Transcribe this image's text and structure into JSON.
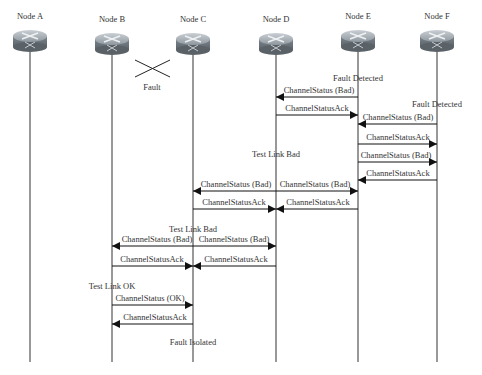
{
  "nodes": [
    {
      "label": "Node A",
      "x": 30
    },
    {
      "label": "Node B",
      "x": 112
    },
    {
      "label": "Node C",
      "x": 193
    },
    {
      "label": "Node D",
      "x": 276
    },
    {
      "label": "Node E",
      "x": 358
    },
    {
      "label": "Node F",
      "x": 437
    }
  ],
  "fault": {
    "label": "Fault"
  },
  "notes": {
    "fault_detected_e": "Fault Detected",
    "fault_detected_f": "Fault Detected",
    "test_link_bad_d": "Test Link Bad",
    "test_link_bad_c": "Test Link Bad",
    "test_link_ok_b": "Test Link OK",
    "fault_isolated": "Fault Isolated"
  },
  "messages": [
    {
      "label": "ChannelStatus (Bad)",
      "from": "E",
      "to": "D"
    },
    {
      "label": "ChannelStatusAck",
      "from": "D",
      "to": "E"
    },
    {
      "label": "ChannelStatus (Bad)",
      "from": "F",
      "to": "E"
    },
    {
      "label": "ChannelStatusAck",
      "from": "E",
      "to": "F"
    },
    {
      "label": "ChannelStatus (Bad)",
      "from": "E",
      "to": "F"
    },
    {
      "label": "ChannelStatusAck",
      "from": "F",
      "to": "E"
    },
    {
      "label": "ChannelStatus (Bad)",
      "from": "D",
      "to": "C"
    },
    {
      "label": "ChannelStatus (Bad)",
      "from": "D",
      "to": "E"
    },
    {
      "label": "ChannelStatusAck",
      "from": "C",
      "to": "D"
    },
    {
      "label": "ChannelStatusAck",
      "from": "E",
      "to": "D"
    },
    {
      "label": "ChannelStatus (Bad)",
      "from": "C",
      "to": "B"
    },
    {
      "label": "ChannelStatus (Bad)",
      "from": "C",
      "to": "D"
    },
    {
      "label": "ChannelStatusAck",
      "from": "B",
      "to": "C"
    },
    {
      "label": "ChannelStatusAck",
      "from": "D",
      "to": "C"
    },
    {
      "label": "ChannelStatus (OK)",
      "from": "B",
      "to": "C"
    },
    {
      "label": "ChannelStatusAck",
      "from": "C",
      "to": "B"
    }
  ]
}
